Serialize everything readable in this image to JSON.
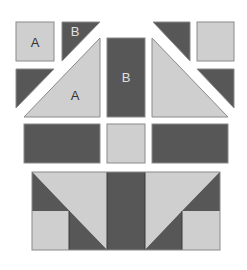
{
  "colors": {
    "dark": "#575757",
    "light": "#cfcfcf",
    "stroke": "#8a8a8a",
    "background": "#ffffff",
    "label_on_light": "#333333",
    "label_on_dark": "#e0e0e0"
  },
  "labels": {
    "square_a": "A",
    "triangle_b": "B",
    "center_rect_b": "B",
    "big_triangle_a": "A"
  },
  "pieces": {
    "top_left_square": {
      "shape": "square",
      "fill": "light",
      "label": "A"
    },
    "top_left_triangle": {
      "shape": "triangle",
      "fill": "dark",
      "label": "B"
    },
    "mid_left_triangle": {
      "shape": "triangle",
      "fill": "dark"
    },
    "big_left_triangle": {
      "shape": "triangle",
      "fill": "light",
      "label": "A"
    },
    "center_rect": {
      "shape": "rectangle",
      "fill": "dark",
      "label": "B"
    },
    "big_right_triangle": {
      "shape": "triangle",
      "fill": "light"
    },
    "top_right_triangle": {
      "shape": "triangle",
      "fill": "dark"
    },
    "top_right_square": {
      "shape": "square",
      "fill": "light"
    },
    "mid_right_triangle": {
      "shape": "triangle",
      "fill": "dark"
    },
    "row3_left_rect": {
      "shape": "rectangle",
      "fill": "dark"
    },
    "row3_center_square": {
      "shape": "square",
      "fill": "light"
    },
    "row3_right_rect": {
      "shape": "rectangle",
      "fill": "dark"
    },
    "assembled_block": {
      "shape": "assembled",
      "description": "sewn unit"
    }
  }
}
